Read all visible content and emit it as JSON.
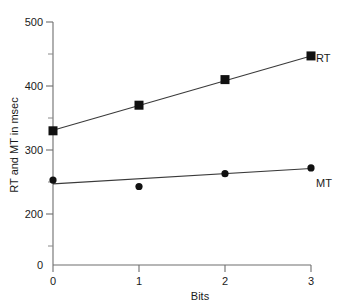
{
  "chart_data": {
    "type": "scatter",
    "title": "",
    "xlabel": "Bits",
    "ylabel": "RT and MT in msec",
    "x": [
      0,
      1,
      2,
      3
    ],
    "xticklabels": [
      "0",
      "1",
      "2",
      "3"
    ],
    "yticklabels": [
      "0",
      "200",
      "300",
      "400",
      "500"
    ],
    "ytickvalues": [
      0,
      200,
      300,
      400,
      500
    ],
    "yminorticks": [
      250,
      350,
      450
    ],
    "xlim": [
      0,
      3
    ],
    "ylim": [
      0,
      500
    ],
    "grid": false,
    "legend_position": "right-of-last-point",
    "series": [
      {
        "name": "RT",
        "label": "RT",
        "marker": "square",
        "color": "#111111",
        "values": [
          330,
          370,
          410,
          447
        ],
        "fit_line": {
          "y_start": 331,
          "y_end": 447
        }
      },
      {
        "name": "MT",
        "label": "MT",
        "marker": "circle",
        "color": "#111111",
        "values": [
          253,
          243,
          263,
          272
        ],
        "fit_line": {
          "y_start": 247,
          "y_end": 271
        }
      }
    ]
  },
  "axes": {
    "y_axis_name": "y-axis",
    "x_axis_name": "x-axis",
    "y_zero_label": "0",
    "x_zero_label": "0"
  }
}
